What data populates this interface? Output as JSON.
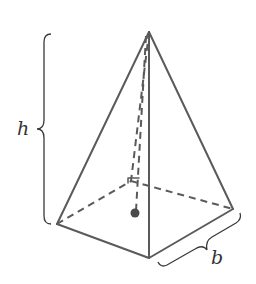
{
  "figure": {
    "labels": {
      "height": "h",
      "base_side": "b"
    },
    "colors": {
      "edges": "#5a5a5a",
      "braces": "#3a3a3a",
      "text": "#333333",
      "background": "#ffffff"
    },
    "vertices": {
      "apex": [
        149,
        32
      ],
      "base_left": [
        57,
        224
      ],
      "base_front": [
        149,
        258
      ],
      "base_right": [
        233,
        209
      ],
      "base_back": [
        131,
        181
      ],
      "base_center": [
        135,
        213
      ]
    }
  }
}
